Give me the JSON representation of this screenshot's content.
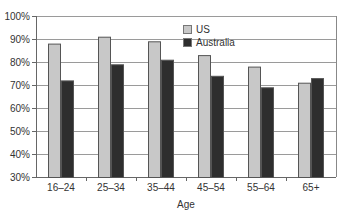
{
  "chart_data": {
    "type": "bar",
    "title": "",
    "xlabel": "Age",
    "ylabel": "",
    "ylim": [
      30,
      100
    ],
    "yticks": [
      "30%",
      "40%",
      "50%",
      "60%",
      "70%",
      "80%",
      "90%",
      "100%"
    ],
    "grid": true,
    "legend_position": "top-center-inside",
    "categories": [
      "16–24",
      "25–34",
      "35–44",
      "45–54",
      "55–64",
      "65+"
    ],
    "series": [
      {
        "name": "US",
        "color": "#c8c8c8",
        "values": [
          88,
          91,
          89,
          83,
          78,
          71
        ]
      },
      {
        "name": "Australia",
        "color": "#2e2e2e",
        "values": [
          72,
          79,
          81,
          74,
          69,
          73
        ]
      }
    ]
  }
}
